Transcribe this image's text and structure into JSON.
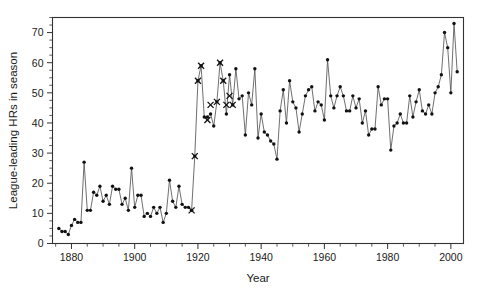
{
  "chart_data": {
    "type": "line",
    "title": "",
    "xlabel": "Year",
    "ylabel": "League-leading HRs in season",
    "xlim": [
      1874,
      2004
    ],
    "ylim": [
      0,
      75
    ],
    "xticks": [
      1880,
      1900,
      1920,
      1940,
      1960,
      1980,
      2000
    ],
    "xtick_labels": [
      "1880",
      "1900",
      "1920",
      "1940",
      "1960",
      "1980",
      "2000"
    ],
    "yticks": [
      0,
      10,
      20,
      30,
      40,
      50,
      60,
      70
    ],
    "ytick_labels": [
      "0",
      "10",
      "20",
      "30",
      "40",
      "50",
      "60",
      "70"
    ],
    "x_minor_step": 5,
    "y_minor_step": 2.5,
    "grid": false,
    "legend": null,
    "marker": "filled-circle",
    "highlight_marker": "x-cross",
    "highlight_note": "X markers overlay the Babe Ruth league-leading seasons (1918-1931)",
    "line_color": "#555555",
    "marker_color": "#111111",
    "frame_color": "#333333",
    "background": "#ffffff",
    "x": [
      1876,
      1877,
      1878,
      1879,
      1880,
      1881,
      1882,
      1883,
      1884,
      1885,
      1886,
      1887,
      1888,
      1889,
      1890,
      1891,
      1892,
      1893,
      1894,
      1895,
      1896,
      1897,
      1898,
      1899,
      1900,
      1901,
      1902,
      1903,
      1904,
      1905,
      1906,
      1907,
      1908,
      1909,
      1910,
      1911,
      1912,
      1913,
      1914,
      1915,
      1916,
      1917,
      1918,
      1919,
      1920,
      1921,
      1922,
      1923,
      1924,
      1925,
      1926,
      1927,
      1928,
      1929,
      1930,
      1931,
      1932,
      1933,
      1934,
      1935,
      1936,
      1937,
      1938,
      1939,
      1940,
      1941,
      1942,
      1943,
      1944,
      1945,
      1946,
      1947,
      1948,
      1949,
      1950,
      1951,
      1952,
      1953,
      1954,
      1955,
      1956,
      1957,
      1958,
      1959,
      1960,
      1961,
      1962,
      1963,
      1964,
      1965,
      1966,
      1967,
      1968,
      1969,
      1970,
      1971,
      1972,
      1973,
      1974,
      1975,
      1976,
      1977,
      1978,
      1979,
      1980,
      1981,
      1982,
      1983,
      1984,
      1985,
      1986,
      1987,
      1988,
      1989,
      1990,
      1991,
      1992,
      1993,
      1994,
      1995,
      1996,
      1997,
      1998,
      1999,
      2000,
      2001,
      2002
    ],
    "values": [
      5,
      4,
      4,
      3,
      6,
      8,
      7,
      7,
      27,
      11,
      11,
      17,
      16,
      19,
      14,
      16,
      13,
      19,
      18,
      18,
      13,
      15,
      11,
      25,
      12,
      16,
      16,
      9,
      10,
      9,
      12,
      10,
      12,
      7,
      10,
      21,
      14,
      12,
      19,
      13,
      12,
      12,
      11,
      29,
      54,
      59,
      42,
      42,
      43,
      39,
      47,
      60,
      54,
      43,
      56,
      46,
      58,
      48,
      49,
      36,
      50,
      46,
      58,
      35,
      43,
      37,
      36,
      34,
      33,
      28,
      44,
      51,
      40,
      54,
      47,
      45,
      37,
      43,
      49,
      51,
      52,
      44,
      47,
      46,
      41,
      61,
      49,
      45,
      49,
      52,
      49,
      44,
      44,
      49,
      45,
      48,
      40,
      44,
      36,
      38,
      38,
      52,
      46,
      48,
      48,
      31,
      39,
      40,
      43,
      40,
      40,
      49,
      42,
      47,
      51,
      44,
      43,
      46,
      43,
      50,
      52,
      56,
      70,
      65,
      50,
      73,
      57
    ],
    "highlight_x": [
      1918,
      1919,
      1920,
      1921,
      1923,
      1924,
      1926,
      1927,
      1928,
      1929,
      1930,
      1931
    ],
    "highlight_values": [
      11,
      29,
      54,
      59,
      41,
      46,
      47,
      60,
      54,
      46,
      49,
      46
    ]
  }
}
